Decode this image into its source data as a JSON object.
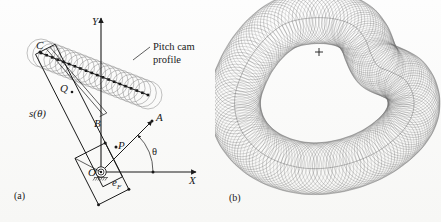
{
  "figure": {
    "background_color": "#fdfdfd",
    "ink_color": "#1a1a1a",
    "circle_color": "#8e8e8e"
  },
  "panels": [
    {
      "id": "a",
      "caption": "(a)",
      "caption_x": 14,
      "caption_y": 199,
      "description": "Kinematic diagram with X-Y axes, pivot at O, follower arm OA at angle theta, roller chain generating pitch cam profile",
      "axes": {
        "origin": {
          "x": 101,
          "y": 172
        },
        "x_axis": {
          "x1": 101,
          "y1": 172,
          "x2": 196,
          "y2": 172,
          "label": "X",
          "label_x": 189,
          "label_y": 184
        },
        "y_axis": {
          "x1": 101,
          "y1": 172,
          "x2": 101,
          "y2": 18,
          "label": "Y",
          "label_x": 92,
          "label_y": 25
        }
      },
      "points": [
        {
          "name": "O",
          "label": "O",
          "x": 101,
          "y": 172,
          "label_x": 88,
          "label_y": 176
        },
        {
          "name": "A",
          "label": "A",
          "x": 152,
          "y": 121,
          "label_x": 156,
          "label_y": 121
        },
        {
          "name": "P",
          "label": "P",
          "x": 116,
          "y": 147,
          "label_x": 118,
          "label_y": 149
        },
        {
          "name": "B",
          "label": "B",
          "x": 97,
          "y": 118,
          "label_x": 94,
          "label_y": 127
        },
        {
          "name": "Q",
          "label": "Q",
          "x": 66,
          "y": 90,
          "label_x": 60,
          "label_y": 92
        },
        {
          "name": "C",
          "label": "C",
          "x": 40,
          "y": 52,
          "label_x": 36,
          "label_y": 49
        }
      ],
      "labels": [
        {
          "name": "displacement-function",
          "text": "s(θ)",
          "x": 29,
          "y": 117,
          "style": "italic"
        },
        {
          "name": "eccentricity",
          "text": "e",
          "sub": "F",
          "x": 112,
          "y": 186,
          "style": "italic"
        },
        {
          "name": "angle-theta",
          "text": "θ",
          "x": 152,
          "y": 155,
          "style": "plain"
        }
      ],
      "annotation": {
        "name": "pitch-cam-profile-callout",
        "lines": [
          "Pitch cam",
          "profile"
        ],
        "text_x": 153,
        "text_y": 50,
        "leader": {
          "x1": 150,
          "y1": 47,
          "x2": 133,
          "y2": 60
        }
      },
      "roller_chain": {
        "count": 20,
        "start": {
          "x": 41,
          "y": 53
        },
        "end": {
          "x": 148,
          "y": 95
        },
        "radius": 14,
        "marker_radius": 1.3
      },
      "theta_arc": {
        "cx": 101,
        "cy": 172,
        "r": 52,
        "start_deg": 0,
        "end_deg": 45
      }
    },
    {
      "id": "b",
      "caption": "(b)",
      "caption_x": 14,
      "caption_y": 201,
      "description": "Complete closed pitch cam profile formed by the envelope of the full family of roller circles, with cam center marked",
      "center_marker": {
        "x": 104,
        "y": 52,
        "size": 4,
        "label": "+"
      },
      "loop": {
        "circle_count": 170,
        "roller_radius": 26,
        "path_points": [
          [
            96,
            18
          ],
          [
            120,
            19
          ],
          [
            139,
            26
          ],
          [
            150,
            39
          ],
          [
            156,
            54
          ],
          [
            163,
            66
          ],
          [
            176,
            72
          ],
          [
            190,
            80
          ],
          [
            198,
            95
          ],
          [
            198,
            112
          ],
          [
            190,
            128
          ],
          [
            176,
            142
          ],
          [
            158,
            154
          ],
          [
            136,
            163
          ],
          [
            112,
            168
          ],
          [
            88,
            168
          ],
          [
            64,
            162
          ],
          [
            44,
            151
          ],
          [
            29,
            135
          ],
          [
            21,
            116
          ],
          [
            20,
            96
          ],
          [
            26,
            76
          ],
          [
            37,
            55
          ],
          [
            53,
            36
          ],
          [
            72,
            23
          ],
          [
            96,
            18
          ]
        ]
      }
    }
  ]
}
